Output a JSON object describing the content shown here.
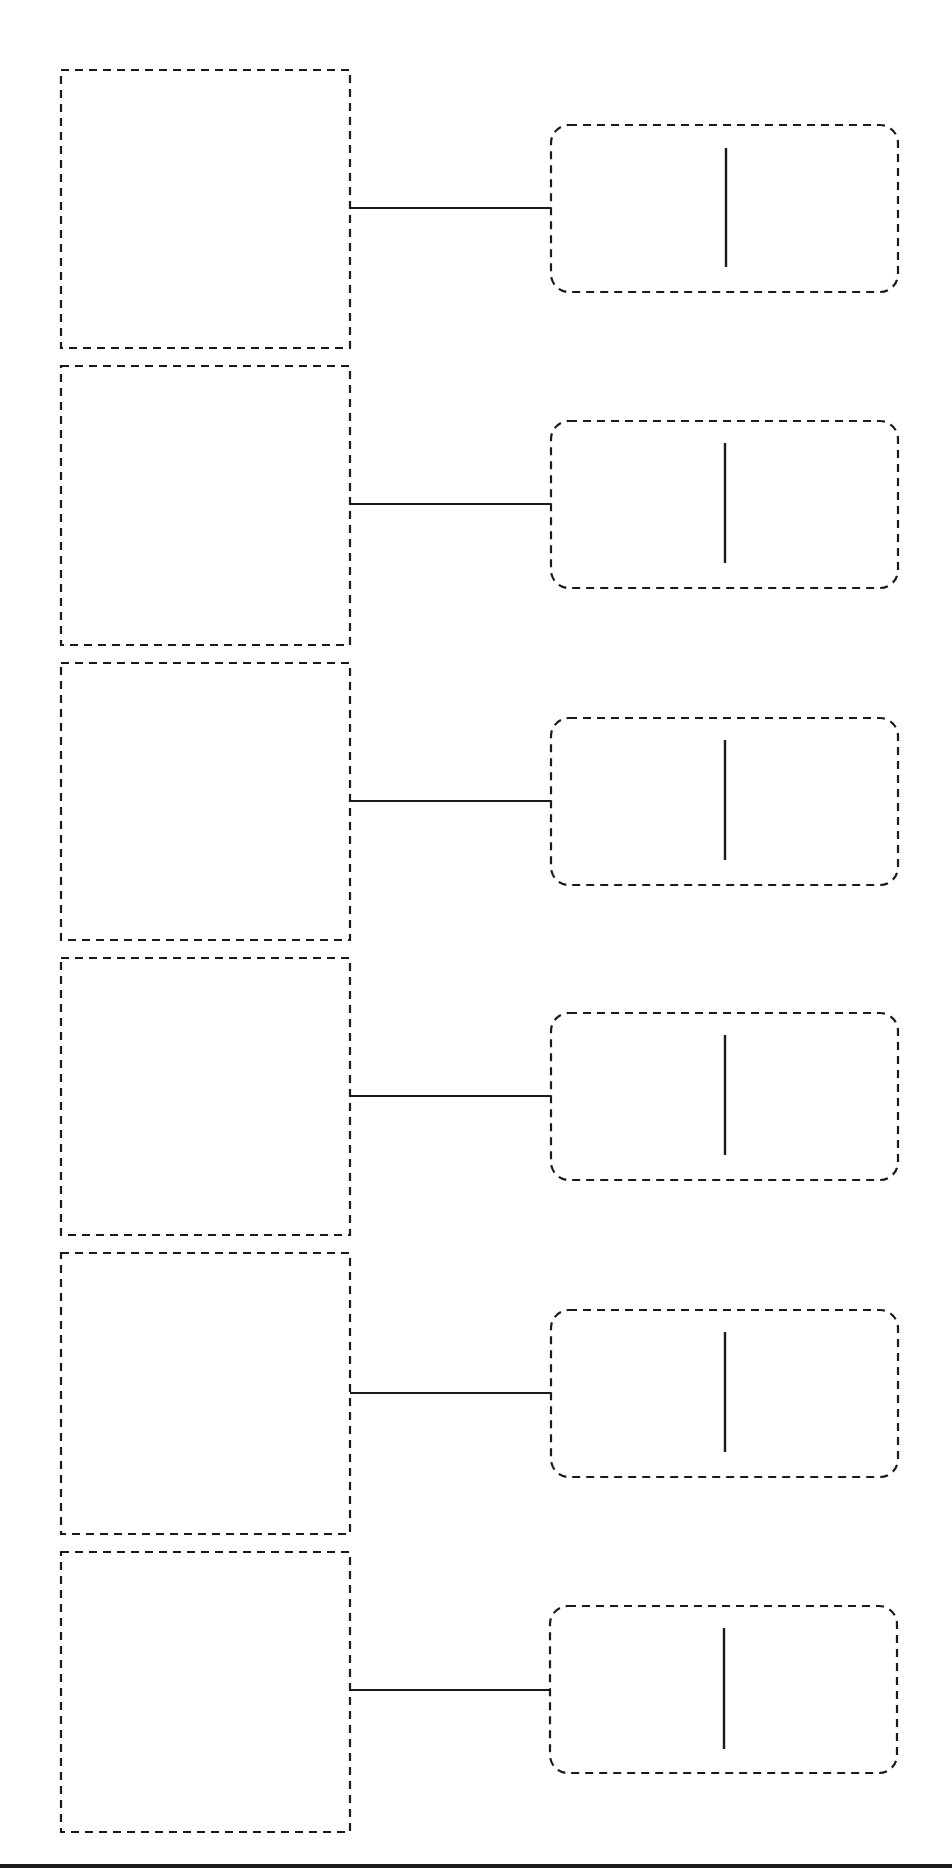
{
  "diagram": {
    "type": "blank-worksheet-template",
    "stroke_color": "#1a1a1a",
    "background_color": "#ffffff",
    "rows": [
      {
        "index": 1,
        "left_box": {
          "x": 61,
          "y": 70,
          "w": 289,
          "h": 278
        },
        "connector_y": 208,
        "right_box": {
          "x": 551,
          "y": 125,
          "w": 347,
          "h": 167
        },
        "divider": {
          "x": 726,
          "y1": 148,
          "y2": 267
        }
      },
      {
        "index": 2,
        "left_box": {
          "x": 61,
          "y": 366,
          "w": 289,
          "h": 279
        },
        "connector_y": 504,
        "right_box": {
          "x": 551,
          "y": 421,
          "w": 347,
          "h": 167
        },
        "divider": {
          "x": 725,
          "y1": 443,
          "y2": 563
        }
      },
      {
        "index": 3,
        "left_box": {
          "x": 61,
          "y": 663,
          "w": 289,
          "h": 277
        },
        "connector_y": 801,
        "right_box": {
          "x": 551,
          "y": 718,
          "w": 347,
          "h": 167
        },
        "divider": {
          "x": 725,
          "y1": 740,
          "y2": 860
        }
      },
      {
        "index": 4,
        "left_box": {
          "x": 61,
          "y": 958,
          "w": 289,
          "h": 277
        },
        "connector_y": 1096,
        "right_box": {
          "x": 551,
          "y": 1013,
          "w": 347,
          "h": 167
        },
        "divider": {
          "x": 725,
          "y1": 1035,
          "y2": 1155
        }
      },
      {
        "index": 5,
        "left_box": {
          "x": 61,
          "y": 1253,
          "w": 289,
          "h": 281
        },
        "connector_y": 1393,
        "right_box": {
          "x": 551,
          "y": 1310,
          "w": 347,
          "h": 167
        },
        "divider": {
          "x": 725,
          "y1": 1332,
          "y2": 1452
        }
      },
      {
        "index": 6,
        "left_box": {
          "x": 61,
          "y": 1552,
          "w": 289,
          "h": 280
        },
        "connector_y": 1690,
        "right_box": {
          "x": 550,
          "y": 1606,
          "w": 347,
          "h": 167
        },
        "divider": {
          "x": 724,
          "y1": 1628,
          "y2": 1749
        }
      }
    ],
    "bottom_rule": {
      "y": 1864,
      "thickness": 4
    }
  }
}
